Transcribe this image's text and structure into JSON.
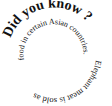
{
  "spiral_text": {
    "headline": "Did you know ?",
    "part_outer": "Elephant meat is sold as",
    "part_inner": "food in certain Asian countries.",
    "full": "Did you know ? Elephant meat is sold as food in certain Asian countries."
  },
  "colors": {
    "text": "#111111",
    "background": "#ffffff"
  }
}
